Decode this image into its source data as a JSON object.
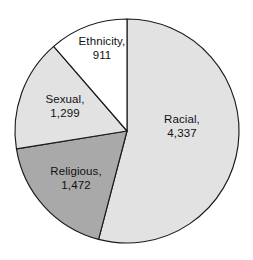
{
  "chart_data": {
    "type": "pie",
    "title": "",
    "subtitle": "",
    "xlabel": "",
    "ylabel": "",
    "legend_position": "none",
    "grid": false,
    "total": 8019,
    "categories": [
      "Racial",
      "Religious",
      "Sexual",
      "Ethnicity"
    ],
    "values": [
      4337,
      1472,
      1299,
      911
    ],
    "value_labels": [
      "4,337",
      "1,472",
      "1,299",
      "911"
    ],
    "slices": [
      {
        "name": "Racial",
        "value": 4337,
        "value_label": "4,337",
        "label_name": "Racial,",
        "percent": 54.1,
        "color": "#e2e2e2",
        "start_angle": 0,
        "end_angle": 194.7,
        "label_x": 182,
        "label_y": 120
      },
      {
        "name": "Religious",
        "value": 1472,
        "value_label": "1,472",
        "label_name": "Religious,",
        "percent": 18.4,
        "color": "#a9a9a9",
        "start_angle": 194.7,
        "end_angle": 260.8,
        "label_x": 76,
        "label_y": 172
      },
      {
        "name": "Sexual",
        "value": 1299,
        "value_label": "1,299",
        "label_name": "Sexual,",
        "percent": 16.2,
        "color": "#e2e2e2",
        "start_angle": 260.8,
        "end_angle": 319.1,
        "label_x": 65,
        "label_y": 100
      },
      {
        "name": "Ethnicity",
        "value": 911,
        "value_label": "911",
        "label_name": "Ethnicity,",
        "percent": 11.4,
        "color": "#ffffff",
        "start_angle": 319.1,
        "end_angle": 360,
        "label_x": 102,
        "label_y": 42
      }
    ],
    "geometry": {
      "center_x": 127,
      "center_y": 131,
      "radius": 112
    },
    "colors": {
      "outline": "#1a1a1a",
      "background": "#ffffff",
      "light_gray": "#e2e2e2",
      "medium_gray": "#a9a9a9",
      "white": "#ffffff",
      "text": "#111111"
    }
  }
}
